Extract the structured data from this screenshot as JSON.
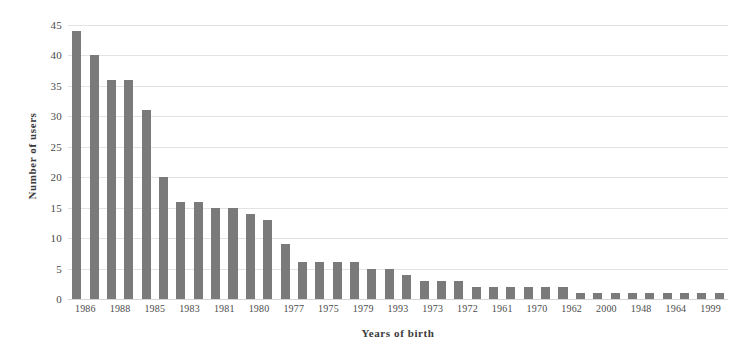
{
  "chart_data": {
    "type": "bar",
    "title": "",
    "xlabel": "Years of birth",
    "ylabel": "Number of users",
    "ylim": [
      0,
      45
    ],
    "ytick_step": 5,
    "yticks": [
      0,
      5,
      10,
      15,
      20,
      25,
      30,
      35,
      40,
      45
    ],
    "grid": true,
    "legend": "none",
    "bar_color": "#7a7a7a",
    "categories": [
      "1986",
      "",
      "1988",
      "",
      "1985",
      "",
      "1983",
      "",
      "1981",
      "",
      "1980",
      "",
      "1977",
      "",
      "1975",
      "",
      "1979",
      "",
      "1993",
      "",
      "1973",
      "",
      "1972",
      "",
      "1961",
      "",
      "1970",
      "",
      "1962",
      "",
      "2000",
      "",
      "1948",
      "",
      "1964",
      "",
      "1999",
      ""
    ],
    "visible_tick_labels": [
      "1986",
      "1988",
      "1985",
      "1983",
      "1981",
      "1980",
      "1977",
      "1975",
      "1979",
      "1993",
      "1973",
      "1972",
      "1961",
      "1970",
      "1962",
      "2000",
      "1948",
      "1964",
      "1999"
    ],
    "values": [
      44,
      40,
      36,
      36,
      31,
      20,
      16,
      16,
      15,
      15,
      14,
      13,
      9,
      6,
      6,
      6,
      6,
      5,
      5,
      4,
      3,
      3,
      3,
      2,
      2,
      2,
      2,
      2,
      2,
      1,
      1,
      1,
      1,
      1,
      1,
      1,
      1,
      1
    ]
  }
}
